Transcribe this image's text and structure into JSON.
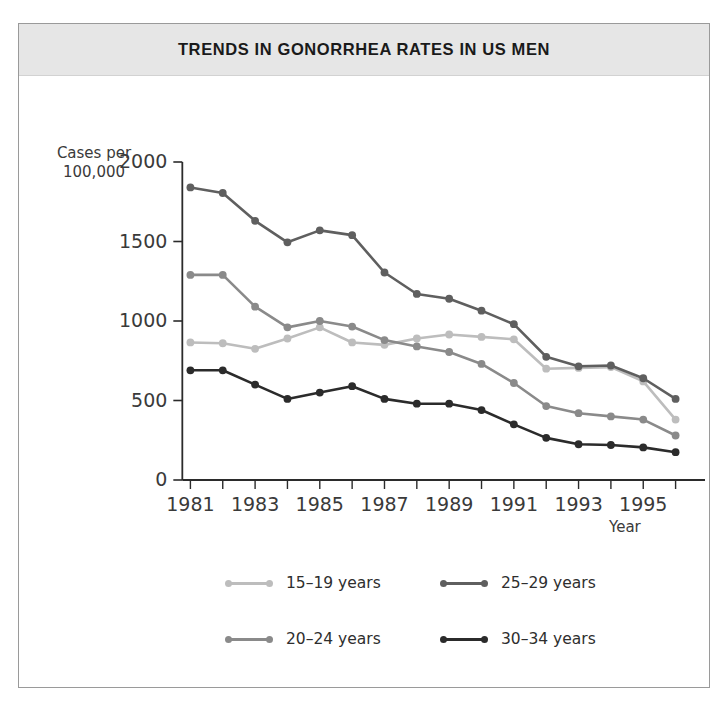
{
  "title": "TRENDS IN GONORRHEA RATES IN US MEN",
  "axis": {
    "ylabel_line1": "Cases per",
    "ylabel_line2": "100,000",
    "xlabel": "Year",
    "yticks": [
      "0",
      "500",
      "1000",
      "1500",
      "2000"
    ],
    "xticks": [
      "1981",
      "1983",
      "1985",
      "1987",
      "1989",
      "1991",
      "1993",
      "1995"
    ]
  },
  "legend": {
    "items": [
      {
        "label": "15–19 years",
        "color": "#bdbdbd"
      },
      {
        "label": "25–29 years",
        "color": "#5f5f5f"
      },
      {
        "label": "20–24 years",
        "color": "#8a8a8a"
      },
      {
        "label": "30–34 years",
        "color": "#2b2b2b"
      }
    ]
  },
  "chart_data": {
    "type": "line",
    "title": "TRENDS IN GONORRHEA RATES IN US MEN",
    "xlabel": "Year",
    "ylabel": "Cases per 100,000",
    "xlim": [
      1980.4,
      1996.6
    ],
    "ylim": [
      0,
      2000
    ],
    "grid": false,
    "legend_position": "bottom",
    "x": [
      1981,
      1982,
      1983,
      1984,
      1985,
      1986,
      1987,
      1988,
      1989,
      1990,
      1991,
      1992,
      1993,
      1994,
      1995,
      1996
    ],
    "xtick_values": [
      1981,
      1983,
      1985,
      1987,
      1989,
      1991,
      1993,
      1995
    ],
    "ytick_values": [
      0,
      500,
      1000,
      1500,
      2000
    ],
    "series": [
      {
        "name": "15–19 years",
        "color": "#bdbdbd",
        "values": [
          865,
          860,
          825,
          890,
          960,
          865,
          850,
          890,
          915,
          900,
          885,
          700,
          705,
          710,
          620,
          380
        ]
      },
      {
        "name": "20–24 years",
        "color": "#8a8a8a",
        "values": [
          1290,
          1290,
          1090,
          960,
          1000,
          965,
          880,
          840,
          805,
          730,
          610,
          465,
          420,
          400,
          380,
          280
        ]
      },
      {
        "name": "25–29 years",
        "color": "#5f5f5f",
        "values": [
          1840,
          1805,
          1630,
          1495,
          1570,
          1540,
          1305,
          1170,
          1140,
          1065,
          980,
          775,
          715,
          720,
          640,
          510
        ]
      },
      {
        "name": "30–34 years",
        "color": "#2b2b2b",
        "values": [
          690,
          690,
          600,
          510,
          550,
          590,
          510,
          480,
          480,
          440,
          350,
          265,
          225,
          220,
          205,
          175
        ]
      }
    ]
  }
}
